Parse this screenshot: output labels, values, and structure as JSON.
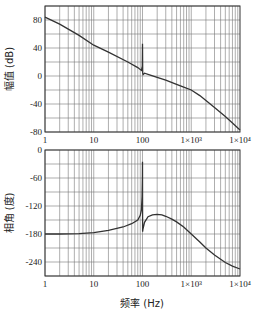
{
  "chart_data": [
    {
      "type": "line",
      "title": "",
      "xlabel": "",
      "ylabel": "幅值 (dB)",
      "xscale": "log",
      "xlim": [
        1,
        10000
      ],
      "ylim": [
        -80,
        100
      ],
      "x_ticks": [
        1,
        10,
        100,
        1000,
        10000
      ],
      "x_tick_labels": [
        "1",
        "10",
        "100",
        "1×10³",
        "1×10⁴"
      ],
      "y_ticks": [
        80,
        40,
        0,
        -40,
        -80
      ],
      "y_tick_labels": [
        "80",
        "40",
        "0",
        "-40",
        "-80"
      ],
      "grid": true,
      "series": [
        {
          "name": "magnitude",
          "x": [
            1,
            2,
            5,
            10,
            20,
            50,
            80,
            95,
            99,
            100,
            101,
            103,
            110,
            150,
            200,
            300,
            500,
            700,
            1000,
            1500,
            2000,
            3000,
            5000,
            7000,
            10000
          ],
          "y": [
            84,
            74,
            58,
            44,
            34,
            20,
            12,
            8,
            14,
            46,
            4,
            2,
            4,
            1,
            -2,
            -6,
            -12,
            -16,
            -20,
            -28,
            -35,
            -45,
            -58,
            -67,
            -77
          ]
        }
      ]
    },
    {
      "type": "line",
      "title": "",
      "xlabel": "频率 (Hz)",
      "ylabel": "相角 (度)",
      "xscale": "log",
      "xlim": [
        1,
        10000
      ],
      "ylim": [
        -270,
        0
      ],
      "x_ticks": [
        1,
        10,
        100,
        1000,
        10000
      ],
      "x_tick_labels": [
        "1",
        "10",
        "100",
        "1×10³",
        "1×10⁴"
      ],
      "y_ticks": [
        0,
        -60,
        -120,
        -180,
        -240
      ],
      "y_tick_labels": [
        "0",
        "-60",
        "-120",
        "-180",
        "-240"
      ],
      "grid": true,
      "series": [
        {
          "name": "phase",
          "x": [
            1,
            2,
            5,
            10,
            20,
            40,
            60,
            80,
            90,
            95,
            98,
            99.5,
            100,
            100.5,
            102,
            110,
            130,
            160,
            200,
            250,
            300,
            400,
            500,
            700,
            1000,
            1500,
            2000,
            3000,
            5000,
            7000,
            10000
          ],
          "y": [
            -180,
            -180,
            -179,
            -177,
            -172,
            -165,
            -158,
            -150,
            -140,
            -128,
            -100,
            -60,
            -25,
            -175,
            -170,
            -155,
            -143,
            -139,
            -138,
            -139,
            -142,
            -148,
            -154,
            -165,
            -180,
            -197,
            -210,
            -225,
            -241,
            -249,
            -255
          ]
        }
      ]
    }
  ],
  "layout": {
    "plot_left": 45,
    "plot_right": 240,
    "top_plot": {
      "top": 6,
      "bottom": 132
    },
    "bottom_plot": {
      "top": 150,
      "bottom": 276
    },
    "mag_grid_step": 20,
    "phase_grid_step": 30,
    "line_color": "#333333",
    "grid_color": "#777777"
  }
}
